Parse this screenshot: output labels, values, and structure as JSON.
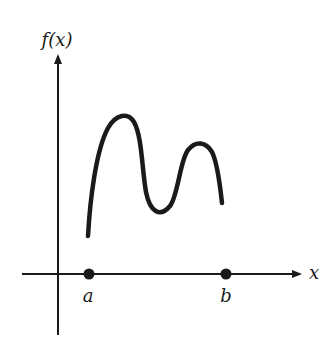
{
  "diagram": {
    "type": "function-graph",
    "y_axis_label": "f(x)",
    "x_axis_label": "x",
    "points": [
      {
        "label": "a",
        "x": 89
      },
      {
        "label": "b",
        "x": 226
      }
    ],
    "curve": {
      "description": "continuous function on [a,b] with two local maxima and one local minimum, not touching endpoints",
      "color": "#1a1a1a"
    }
  }
}
